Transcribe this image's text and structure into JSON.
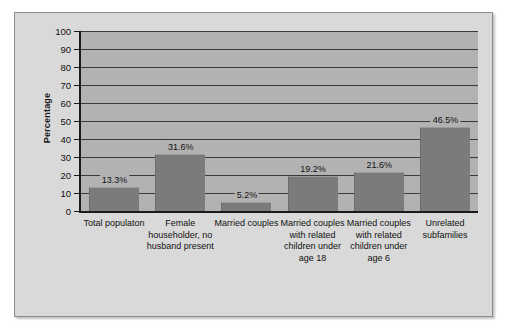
{
  "chart_data": {
    "type": "bar",
    "title": "",
    "xlabel": "",
    "ylabel": "Percentage",
    "ylim": [
      0,
      100
    ],
    "ytick_step": 10,
    "yticks": [
      100,
      90,
      80,
      70,
      60,
      50,
      40,
      30,
      20,
      10,
      0
    ],
    "grid": true,
    "legend": "none",
    "categories": [
      "Total populaton",
      "Female householder, no husband present",
      "Married couples",
      "Married couples with related children under age 18",
      "Married couples with related children under age 6",
      "Unrelated subfamilies"
    ],
    "values": [
      13.3,
      31.6,
      5.2,
      19.2,
      21.6,
      46.5
    ],
    "value_labels": [
      "13.3%",
      "31.6%",
      "5.2%",
      "19.2%",
      "21.6%",
      "46.5%"
    ],
    "bar_color": "#7b7b7b",
    "plot_background": "#b2b2b2",
    "figure_background": "#d9d9d9"
  }
}
